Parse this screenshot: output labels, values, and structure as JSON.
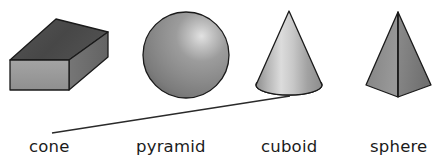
{
  "figure": {
    "background_color": "#ffffff",
    "outline_color": "#1a1a1a",
    "text_color": "#1b1b1b"
  },
  "shapes": [
    {
      "id": "cuboid-shape",
      "kind": "cuboid",
      "position": "first-from-left",
      "front_face_color": "#9a9a9a",
      "top_face_color": "#4a4a4a",
      "side_face_color": "#6e6e6e"
    },
    {
      "id": "sphere-shape",
      "kind": "sphere",
      "position": "second-from-left",
      "base_color": "#8d8d8d",
      "highlight_color": "#d8d8d8",
      "shadow_color": "#6a6a6a"
    },
    {
      "id": "cone-shape",
      "kind": "cone",
      "position": "third-from-left",
      "body_light_color": "#d5d5d5",
      "body_dark_color": "#8f8f8f",
      "base_color": "#8a8a8a"
    },
    {
      "id": "pyramid-shape",
      "kind": "pyramid",
      "position": "fourth-from-left",
      "left_face_color": "#8c8c8c",
      "right_face_color": "#7c7c7c"
    }
  ],
  "connector_line": {
    "id": "matching-line",
    "from_label": "cone",
    "to_shape": "cone-shape",
    "color": "#2a2a2a",
    "stroke_width": 1.4
  },
  "labels": {
    "cone": "cone",
    "pyramid": "pyramid",
    "cuboid": "cuboid",
    "sphere": "sphere"
  }
}
